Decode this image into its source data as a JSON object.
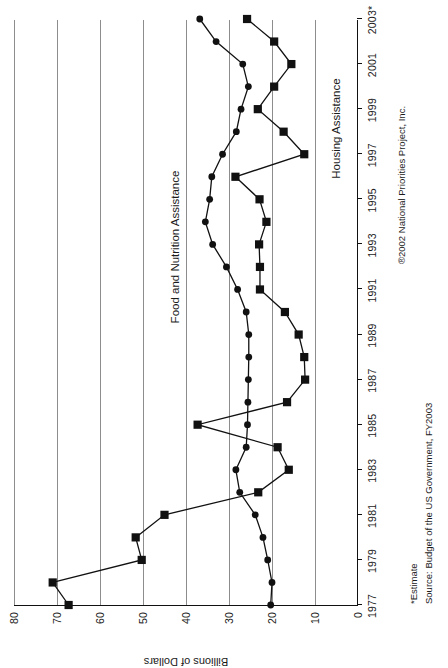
{
  "chart_data": {
    "type": "line",
    "title": "",
    "xlabel": "",
    "ylabel": "Billions of Dollars",
    "ylim": [
      0,
      80
    ],
    "ytick_step": 10,
    "yticks": [
      "0",
      "10",
      "20",
      "30",
      "40",
      "50",
      "60",
      "70",
      "80"
    ],
    "grid": true,
    "legend": "inline-labels",
    "x": [
      1977,
      1978,
      1979,
      1980,
      1981,
      1982,
      1983,
      1984,
      1985,
      1986,
      1987,
      1988,
      1989,
      1990,
      1991,
      1992,
      1993,
      1994,
      1995,
      1996,
      1997,
      1998,
      1999,
      2000,
      2001,
      2002,
      2003
    ],
    "xticks": [
      "1977",
      "1979",
      "1981",
      "1983",
      "1985",
      "1987",
      "1989",
      "1991",
      "1993",
      "1995",
      "1997",
      "1999",
      "2001",
      "2003*"
    ],
    "xtick_values": [
      1977,
      1979,
      1981,
      1983,
      1985,
      1987,
      1989,
      1991,
      1993,
      1995,
      1997,
      1999,
      2001,
      2003
    ],
    "series": [
      {
        "name": "Food and Nutrition Assistance",
        "marker": "circle",
        "values": [
          20.3,
          20.0,
          21.0,
          22.1,
          23.9,
          27.5,
          28.4,
          26.0,
          25.7,
          25.6,
          25.5,
          25.4,
          25.4,
          26.0,
          28.0,
          30.6,
          33.8,
          35.5,
          34.5,
          34.0,
          31.5,
          28.3,
          27.2,
          25.5,
          26.8,
          33.0,
          36.8
        ]
      },
      {
        "name": "Housing Assistance",
        "marker": "square",
        "values": [
          67.3,
          71.0,
          50.3,
          51.7,
          45.0,
          23.2,
          16.1,
          18.7,
          37.3,
          16.5,
          12.3,
          12.5,
          13.8,
          17.0,
          22.8,
          22.8,
          23.0,
          21.3,
          22.9,
          28.5,
          12.5,
          17.3,
          23.3,
          19.5,
          15.5,
          19.5,
          25.8
        ]
      }
    ]
  },
  "series_labels": {
    "food": "Food and Nutrition Assistance",
    "housing": "Housing Assistance"
  },
  "footnotes": {
    "estimate": "*Estimate",
    "source": "Source: Budget of the US Government, FY2003",
    "copyright": "®2002 National Priorities Project, Inc."
  },
  "axis": {
    "y_title": "Billions of Dollars"
  }
}
